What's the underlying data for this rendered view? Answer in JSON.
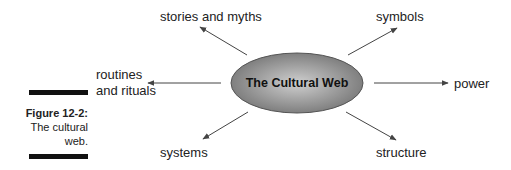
{
  "figure": {
    "number_label": "Figure 12-2:",
    "caption_line1": "The cultural",
    "caption_line2": "web."
  },
  "diagram": {
    "center": {
      "label": "The Cultural Web",
      "fill_colors": [
        "#c8c8c8",
        "#7a7a7a"
      ],
      "stroke": "#555555"
    },
    "nodes": [
      {
        "id": "stories",
        "label": "stories and myths"
      },
      {
        "id": "symbols",
        "label": "symbols"
      },
      {
        "id": "routines",
        "label_line1": "routines",
        "label_line2": "and rituals"
      },
      {
        "id": "power",
        "label": "power"
      },
      {
        "id": "systems",
        "label": "systems"
      },
      {
        "id": "structure",
        "label": "structure"
      }
    ],
    "arrow_color": "#444444"
  }
}
